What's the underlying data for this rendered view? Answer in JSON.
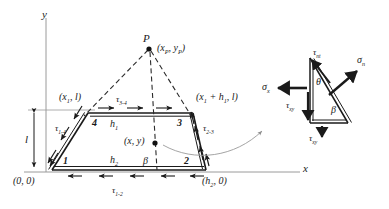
{
  "figure": {
    "axes": {
      "x_label": "x",
      "y_label": "y"
    },
    "colors": {
      "line": "#1a1a1a",
      "dashed": "#2b2b2b",
      "thin_gray": "#9a9a9a",
      "text": "#1a1a1a",
      "background": "#ffffff"
    },
    "trapezoid": {
      "nodes": [
        {
          "id": "1",
          "label": "1",
          "corner": "bottom-left"
        },
        {
          "id": "2",
          "label": "2",
          "corner": "bottom-right"
        },
        {
          "id": "3",
          "label": "3",
          "corner": "top-right"
        },
        {
          "id": "4",
          "label": "4",
          "corner": "top-left"
        }
      ],
      "edge_tractions": [
        {
          "name": "tau_1_4",
          "symbol": "τ",
          "sub": "1-4",
          "edge": "1-4"
        },
        {
          "name": "tau_3_4",
          "symbol": "τ",
          "sub": "3-4",
          "edge": "3-4"
        },
        {
          "name": "tau_2_3",
          "symbol": "τ",
          "sub": "2-3",
          "edge": "2-3"
        },
        {
          "name": "tau_1_2",
          "symbol": "τ",
          "sub": "1-2",
          "edge": "1-2"
        }
      ],
      "dimensions": [
        {
          "name": "h1",
          "symbol": "h",
          "sub": "1",
          "desc": "top width"
        },
        {
          "name": "h2",
          "symbol": "h",
          "sub": "2",
          "desc": "bottom width"
        },
        {
          "name": "l",
          "symbol": "l",
          "desc": "height"
        }
      ],
      "angle_label": {
        "symbol": "β",
        "desc": "interior angle at base"
      }
    },
    "coordinates": {
      "origin": "(0, 0)",
      "bottom_right": "(h₂, 0)",
      "top_left": "(x₁, l)",
      "top_right": "(x₁ + h₁, l)",
      "apex": "(xₐ, yₐ)",
      "interior_point": "(x, y)"
    },
    "apex": {
      "label": "P",
      "coord_text": "(x_P, y_P)"
    },
    "stress_element": {
      "labels": [
        {
          "name": "sigma_n",
          "symbol": "σ",
          "sub": "n",
          "desc": "normal stress on inclined face"
        },
        {
          "name": "tau_nt",
          "symbol": "τ",
          "sub": "nt",
          "desc": "shear stress on inclined face"
        },
        {
          "name": "sigma_x",
          "symbol": "σ",
          "sub": "x",
          "desc": "normal stress on vertical face"
        },
        {
          "name": "tau_xy_vertical",
          "symbol": "τ",
          "sub": "xy",
          "desc": "shear stress on vertical face"
        },
        {
          "name": "tau_xy_horizontal",
          "symbol": "τ",
          "sub": "xy",
          "desc": "shear stress on horizontal face"
        },
        {
          "name": "theta",
          "symbol": "θ",
          "desc": "angle at top vertex"
        },
        {
          "name": "beta",
          "symbol": "β",
          "desc": "angle at bottom-right vertex"
        }
      ]
    }
  }
}
